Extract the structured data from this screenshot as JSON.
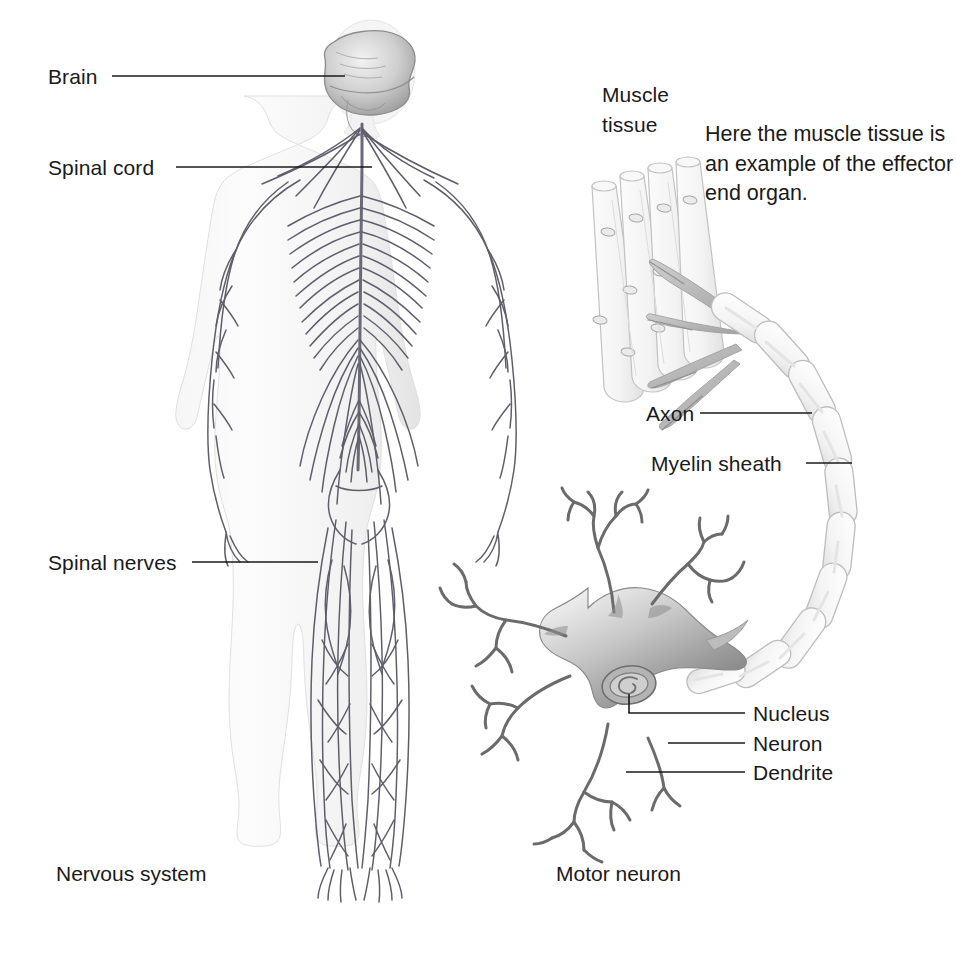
{
  "figure": {
    "title_hidden": "Nervous system and motor neuron diagram",
    "background_color": "#ffffff",
    "ink_color": "#4d4d4d",
    "text_color": "#1a1a1a",
    "leader_color": "#1a1a1a"
  },
  "labels": {
    "brain": "Brain",
    "spinal_cord": "Spinal cord",
    "spinal_nerves": "Spinal nerves",
    "muscle_tissue": "Muscle\ntissue",
    "muscle_tissue_line1": "Muscle",
    "muscle_tissue_line2": "tissue",
    "axon": "Axon",
    "myelin_sheath": "Myelin sheath",
    "nucleus": "Nucleus",
    "neuron": "Neuron",
    "dendrite": "Dendrite"
  },
  "note": {
    "text": "Here the muscle tissue is\nan example of the effector\nend organ.",
    "line1": "Here the muscle tissue is",
    "line2": "an example of the effector",
    "line3": "end organ."
  },
  "captions": {
    "left": "Nervous system",
    "right": "Motor neuron"
  },
  "icons": {
    "brain": "brain-icon",
    "human_body": "human-body-icon",
    "muscle_fiber": "muscle-fiber-icon",
    "neuron_soma": "neuron-soma-icon",
    "nucleus": "nucleus-icon",
    "myelin_segment": "myelin-segment-icon"
  }
}
